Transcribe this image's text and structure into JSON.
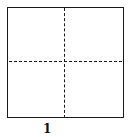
{
  "figure": {
    "label": "1",
    "shape": "square",
    "divisions": "vertical and horizontal dashed center lines",
    "line_color": "#1a1a1a",
    "background": "#ffffff"
  }
}
